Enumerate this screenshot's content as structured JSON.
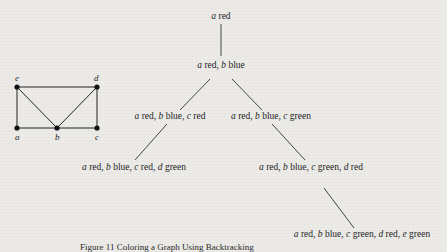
{
  "graph": {
    "vertices": [
      {
        "id": "e",
        "label": "e",
        "x": 17,
        "y": 85
      },
      {
        "id": "d",
        "label": "d",
        "x": 97,
        "y": 85
      },
      {
        "id": "a",
        "label": "a",
        "x": 17,
        "y": 128
      },
      {
        "id": "b",
        "label": "b",
        "x": 57,
        "y": 128
      },
      {
        "id": "c",
        "label": "c",
        "x": 97,
        "y": 128
      }
    ],
    "edges": [
      [
        "e",
        "d"
      ],
      [
        "e",
        "a"
      ],
      [
        "e",
        "b"
      ],
      [
        "d",
        "b"
      ],
      [
        "d",
        "c"
      ],
      [
        "a",
        "b"
      ],
      [
        "b",
        "c"
      ]
    ]
  },
  "tree": {
    "nodes": [
      {
        "id": "n0",
        "parts": [
          [
            "a",
            " red"
          ]
        ]
      },
      {
        "id": "n1",
        "parts": [
          [
            "a",
            " red, "
          ],
          [
            "b",
            " blue"
          ]
        ]
      },
      {
        "id": "n2",
        "parts": [
          [
            "a",
            " red, "
          ],
          [
            "b",
            " blue, "
          ],
          [
            "c",
            " red"
          ]
        ]
      },
      {
        "id": "n3",
        "parts": [
          [
            "a",
            " red, "
          ],
          [
            "b",
            " blue, "
          ],
          [
            "c",
            " green"
          ]
        ]
      },
      {
        "id": "n4",
        "parts": [
          [
            "a",
            " red, "
          ],
          [
            "b",
            " blue, "
          ],
          [
            "c",
            " red, "
          ],
          [
            "d",
            " green"
          ]
        ]
      },
      {
        "id": "n5",
        "parts": [
          [
            "a",
            " red, "
          ],
          [
            "b",
            " blue, "
          ],
          [
            "c",
            " green, "
          ],
          [
            "d",
            " red"
          ]
        ]
      },
      {
        "id": "n6",
        "parts": [
          [
            "a",
            " red, "
          ],
          [
            "b",
            " blue, "
          ],
          [
            "c",
            " green, "
          ],
          [
            "d",
            " red, "
          ],
          [
            "e",
            " green"
          ]
        ]
      }
    ]
  },
  "caption": "Figure 11   Coloring a Graph Using Backtracking"
}
